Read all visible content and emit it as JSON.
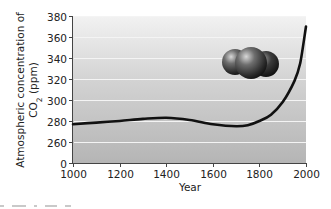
{
  "chart_data": {
    "type": "line",
    "title": "",
    "xlabel": "Year",
    "ylabel_line1": "Atmospheric concentration of",
    "ylabel_line2_pre": "CO",
    "ylabel_line2_sub": "2",
    "ylabel_line2_post": " (ppm)",
    "ylabel": "Atmospheric concentration of CO2 (ppm)",
    "xlim": [
      1000,
      2000
    ],
    "ylim": [
      0,
      380
    ],
    "axis_break": "y-axis jumps from 0 to 260",
    "x_ticks": [
      "1000",
      "1200",
      "1400",
      "1600",
      "1800",
      "2000"
    ],
    "y_ticks": [
      "0",
      "260",
      "280",
      "300",
      "320",
      "340",
      "360",
      "380"
    ],
    "grid": "horizontal white gridlines at each y tick",
    "legend": "none",
    "series": [
      {
        "name": "CO2 concentration",
        "color": "#111111",
        "x": [
          1000,
          1100,
          1200,
          1300,
          1400,
          1500,
          1600,
          1700,
          1750,
          1800,
          1850,
          1900,
          1950,
          1975,
          2000
        ],
        "values": [
          277,
          278.5,
          280,
          282,
          283,
          281,
          277,
          275,
          276,
          280,
          286,
          298,
          318,
          335,
          370
        ]
      }
    ],
    "annotations": [
      "CO2 molecule illustration (three spheres) in upper right of plot"
    ]
  },
  "colors": {
    "plot_bg_top": "#f2f2f2",
    "plot_bg_bottom": "#b5b5b5",
    "gridline": "#f4f4f4",
    "line": "#111111",
    "axis": "#444444"
  }
}
